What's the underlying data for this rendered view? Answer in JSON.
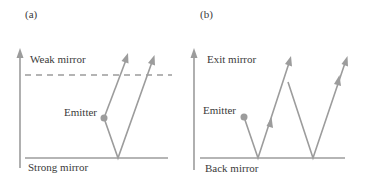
{
  "panels": [
    {
      "id": "a",
      "label": "(a)",
      "top_mirror": "Weak mirror",
      "emitter": "Emitter",
      "bottom_mirror": "Strong mirror"
    },
    {
      "id": "b",
      "label": "(b)",
      "top_mirror": "Exit mirror",
      "emitter": "Emitter",
      "bottom_mirror": "Back mirror"
    }
  ],
  "colors": {
    "line": "#9c9c9c",
    "text": "#3a3a3a",
    "background": "#ffffff"
  }
}
